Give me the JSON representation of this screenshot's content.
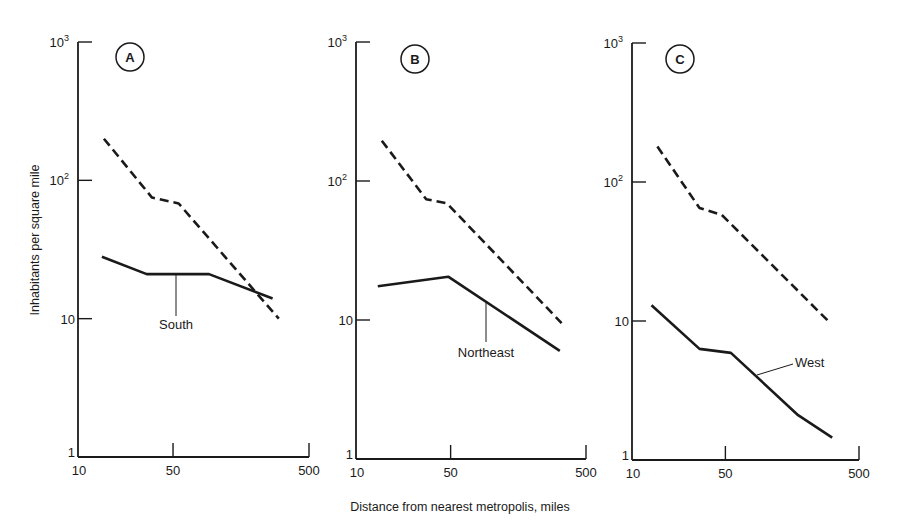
{
  "figure": {
    "ylabel": "Inhabitants per square mile",
    "xlabel": "Distance from nearest metropolis, miles"
  },
  "chart_data": [
    {
      "type": "line",
      "panel": "A",
      "title": "A",
      "xscale": "log",
      "yscale": "log",
      "xlabel": "Distance from nearest metropolis, miles",
      "ylabel": "Inhabitants per square mile",
      "xlim": [
        10,
        500
      ],
      "ylim": [
        1,
        1000
      ],
      "xticks": [
        10,
        50,
        500
      ],
      "xtick_labels": [
        "10",
        "50",
        "500"
      ],
      "yticks": [
        1,
        10,
        100,
        1000
      ],
      "ytick_labels": [
        "1",
        "10",
        "10^2",
        "10^3"
      ],
      "grid": false,
      "series": [
        {
          "name": "National (dashed)",
          "style": "dashed",
          "x": [
            15.5,
            35,
            55,
            300
          ],
          "y": [
            200,
            75,
            68,
            10
          ]
        },
        {
          "name": "South",
          "style": "solid",
          "label": "South",
          "x": [
            15,
            32,
            92,
            270
          ],
          "y": [
            28,
            21,
            21,
            14
          ]
        }
      ]
    },
    {
      "type": "line",
      "panel": "B",
      "title": "B",
      "xscale": "log",
      "yscale": "log",
      "xlabel": "Distance from nearest metropolis, miles",
      "ylabel": "Inhabitants per square mile",
      "xlim": [
        10,
        500
      ],
      "ylim": [
        1,
        1000
      ],
      "xticks": [
        10,
        50,
        500
      ],
      "xtick_labels": [
        "10",
        "50",
        "500"
      ],
      "yticks": [
        1,
        10,
        100,
        1000
      ],
      "ytick_labels": [
        "1",
        "10",
        "10^2",
        "10^3"
      ],
      "grid": false,
      "series": [
        {
          "name": "National (dashed)",
          "style": "dashed",
          "x": [
            15.5,
            33,
            47,
            330
          ],
          "y": [
            195,
            74,
            69,
            9.5
          ]
        },
        {
          "name": "Northeast",
          "style": "solid",
          "label": "Northeast",
          "x": [
            14.5,
            48,
            320
          ],
          "y": [
            17.5,
            20.5,
            6
          ]
        }
      ]
    },
    {
      "type": "line",
      "panel": "C",
      "title": "C",
      "xscale": "log",
      "yscale": "log",
      "xlabel": "Distance from nearest metropolis, miles",
      "ylabel": "Inhabitants per square mile",
      "xlim": [
        10,
        500
      ],
      "ylim": [
        1,
        1000
      ],
      "xticks": [
        10,
        50,
        500
      ],
      "xtick_labels": [
        "10",
        "50",
        "500"
      ],
      "yticks": [
        1,
        10,
        100,
        1000
      ],
      "ytick_labels": [
        "1",
        "10",
        "10^2",
        "10^3"
      ],
      "grid": false,
      "series": [
        {
          "name": "National (dashed)",
          "style": "dashed",
          "x": [
            15.5,
            32,
            47,
            300
          ],
          "y": [
            180,
            65,
            58,
            9.8
          ]
        },
        {
          "name": "West",
          "style": "solid",
          "label": "West",
          "x": [
            14,
            32,
            55,
            175,
            315
          ],
          "y": [
            13,
            6.3,
            5.9,
            2.1,
            1.45
          ]
        }
      ]
    }
  ],
  "layout": {
    "panels": [
      {
        "x0": 78,
        "x1": 309,
        "y_top": 42,
        "y_bot": 457,
        "circle": {
          "cx": 130,
          "cy": 57
        },
        "label": {
          "text": "South",
          "x": 176,
          "y": 329,
          "anchor": "middle",
          "line": [
            176,
            273,
            176,
            316
          ]
        }
      },
      {
        "x0": 356,
        "x1": 586,
        "y_top": 42,
        "y_bot": 459,
        "circle": {
          "cx": 415,
          "cy": 59
        },
        "label": {
          "text": "Northeast",
          "x": 486,
          "y": 357,
          "anchor": "middle",
          "line": [
            486,
            303,
            486,
            342
          ]
        }
      },
      {
        "x0": 632,
        "x1": 859,
        "y_top": 43,
        "y_bot": 460,
        "circle": {
          "cx": 680,
          "cy": 59
        },
        "label": {
          "text": "West",
          "x": 795,
          "y": 367,
          "anchor": "start",
          "line": [
            757,
            375,
            793,
            364
          ]
        }
      }
    ]
  }
}
